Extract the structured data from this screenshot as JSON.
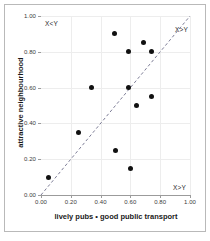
{
  "chart_data": {
    "type": "scatter",
    "title": "",
    "xlabel": "lively pubs • good public transport",
    "ylabel": "attractive neighbourhood",
    "xlim": [
      0.0,
      1.0
    ],
    "ylim": [
      0.0,
      1.0
    ],
    "grid": true,
    "legend": "none",
    "x_tick_labels": [
      "0.00",
      "0.20",
      "0.40",
      "0.60",
      "0.80",
      "1.00"
    ],
    "y_tick_labels": [
      "0.00",
      "0.20",
      "0.40",
      "0.60",
      "0.80",
      "1.00"
    ],
    "x_ticks": [
      0.0,
      0.2,
      0.4,
      0.6,
      0.8,
      1.0
    ],
    "y_ticks": [
      0.0,
      0.2,
      0.4,
      0.6,
      0.8,
      1.0
    ],
    "points": [
      {
        "x": 0.05,
        "y": 0.1
      },
      {
        "x": 0.25,
        "y": 0.35
      },
      {
        "x": 0.34,
        "y": 0.6
      },
      {
        "x": 0.49,
        "y": 0.9
      },
      {
        "x": 0.5,
        "y": 0.25
      },
      {
        "x": 0.59,
        "y": 0.8
      },
      {
        "x": 0.59,
        "y": 0.6
      },
      {
        "x": 0.6,
        "y": 0.15
      },
      {
        "x": 0.64,
        "y": 0.5
      },
      {
        "x": 0.69,
        "y": 0.85
      },
      {
        "x": 0.74,
        "y": 0.8
      },
      {
        "x": 0.74,
        "y": 0.55
      }
    ],
    "reference_line": {
      "name": "identity-line",
      "equation": "X=Y",
      "style": "dashed",
      "color": "#6e6e8a",
      "from": {
        "x": 0.0,
        "y": 0.0
      },
      "to": {
        "x": 1.0,
        "y": 1.0
      }
    },
    "annotations": [
      {
        "id": "x-lt-y",
        "text": "X<Y",
        "position": "top-left"
      },
      {
        "id": "x-gt-y-upper",
        "text": "X>Y",
        "position": "top-right"
      },
      {
        "id": "x-gt-y-lower",
        "text": "X>Y",
        "position": "bottom-right"
      }
    ],
    "colors": {
      "point": "#111111",
      "gridline": "#ededed",
      "axis": "#9b9b9b",
      "reference_line": "#6e6e8a",
      "frame": "#b9b9b9",
      "text": "#1a1a1a"
    }
  }
}
